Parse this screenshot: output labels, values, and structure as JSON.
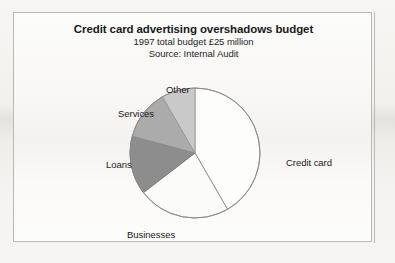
{
  "figure": {
    "title": "Credit card advertising overshadows budget",
    "subtitle_1": "1997 total budget £25 million",
    "subtitle_2": "Source: Internal Audit"
  },
  "chart_data": {
    "type": "pie",
    "title": "Credit card advertising overshadows budget",
    "subtitle": "1997 total budget £25 million",
    "source": "Source: Internal Audit",
    "unit": "£ million",
    "total": 25,
    "currency_symbol": "£",
    "year": 1997,
    "legend": "none (direct slice labels)",
    "start_angle_deg": 0,
    "direction": "clockwise",
    "categories": [
      "Credit card",
      "Businesses",
      "Loans",
      "Services",
      "Other"
    ],
    "values": [
      40,
      22,
      14,
      12,
      8
    ],
    "value_unit": "percent",
    "slices": [
      {
        "label": "Credit card",
        "percent": 40,
        "color": "#fdfdfc",
        "stroke": "#8c8c8c",
        "label_position": "right"
      },
      {
        "label": "Businesses",
        "percent": 22,
        "color": "#fbfbfa",
        "stroke": "#8c8c8c",
        "label_position": "bottom-left"
      },
      {
        "label": "Loans",
        "percent": 14,
        "color": "#8d8d8d",
        "stroke": "#7a7a7a",
        "label_position": "left"
      },
      {
        "label": "Services",
        "percent": 12,
        "color": "#ababab",
        "stroke": "#8c8c8c",
        "label_position": "upper-left"
      },
      {
        "label": "Other",
        "percent": 8,
        "color": "#c9c9c9",
        "stroke": "#9a9a9a",
        "label_position": "top"
      }
    ],
    "xlabel": "",
    "ylabel": ""
  },
  "colors": {
    "page_background": "#f5f4f2",
    "panel_background": "#fbfbfa",
    "frame_border": "#b9b8b4",
    "text": "#1a1a1a"
  }
}
